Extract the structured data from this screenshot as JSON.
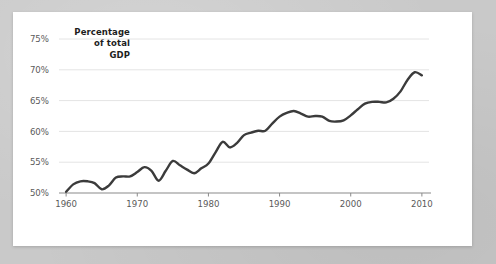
{
  "chart_data": {
    "type": "line",
    "title": "",
    "subtitle": "",
    "xlabel": "",
    "ylabel": "Percentage of total GDP",
    "ylabel_lines": [
      "Percentage",
      "of total",
      "GDP"
    ],
    "xlim": [
      1959,
      2011
    ],
    "ylim": [
      50,
      75
    ],
    "yticks": [
      50,
      55,
      60,
      65,
      70,
      75
    ],
    "ytick_labels": [
      "50%",
      "55%",
      "60%",
      "65%",
      "70%",
      "75%"
    ],
    "xticks": [
      1960,
      1970,
      1980,
      1990,
      2000,
      2010
    ],
    "xtick_labels": [
      "1960",
      "1970",
      "1980",
      "1990",
      "2000",
      "2010"
    ],
    "grid": true,
    "grid_axis": "y",
    "legend": false,
    "legend_position": "none",
    "line_color": "#3b3b3b",
    "grid_color": "#e4e4e4",
    "axis_color": "#8a8a8a",
    "tick_text_color": "#5a5a5a",
    "label_text_color": "#1d1d1d",
    "background_color": "#ffffff",
    "page_background_color": "#c9c9c9",
    "series": [
      {
        "name": "Percentage of total GDP",
        "x": [
          1960,
          1961,
          1962,
          1963,
          1964,
          1965,
          1966,
          1967,
          1968,
          1969,
          1970,
          1971,
          1972,
          1973,
          1974,
          1975,
          1976,
          1977,
          1978,
          1979,
          1980,
          1981,
          1982,
          1983,
          1984,
          1985,
          1986,
          1987,
          1988,
          1989,
          1990,
          1991,
          1992,
          1993,
          1994,
          1995,
          1996,
          1997,
          1998,
          1999,
          2000,
          2001,
          2002,
          2003,
          2004,
          2005,
          2006,
          2007,
          2008,
          2009,
          2010
        ],
        "values": [
          50.2,
          51.4,
          51.9,
          51.9,
          51.6,
          50.6,
          51.2,
          52.5,
          52.7,
          52.7,
          53.4,
          54.2,
          53.6,
          52.0,
          53.6,
          55.2,
          54.5,
          53.8,
          53.2,
          54.0,
          54.8,
          56.6,
          58.3,
          57.4,
          58.1,
          59.4,
          59.8,
          60.1,
          60.1,
          61.3,
          62.4,
          63.0,
          63.3,
          62.9,
          62.4,
          62.5,
          62.4,
          61.7,
          61.6,
          61.8,
          62.6,
          63.6,
          64.5,
          64.8,
          64.8,
          64.7,
          65.3,
          66.5,
          68.4,
          69.6,
          69.1
        ]
      }
    ]
  },
  "figure": {
    "ytick_label_x": 36,
    "plot_left": 46,
    "plot_right": 416,
    "plot_top": 27,
    "plot_bottom": 181
  }
}
